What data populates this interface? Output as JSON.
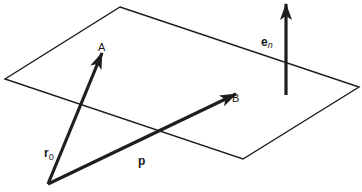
{
  "figure": {
    "colors": {
      "line": "#1e1e1e",
      "background": "#ffffff"
    },
    "plane": {
      "corners": [
        [
          120,
          7
        ],
        [
          359,
          87
        ],
        [
          243,
          159
        ],
        [
          5,
          79
        ]
      ]
    },
    "vectors": {
      "r0": {
        "from": [
          48,
          184
        ],
        "to": [
          102,
          53
        ]
      },
      "p": {
        "from": [
          48,
          184
        ],
        "to": [
          236,
          94
        ]
      },
      "en": {
        "from": [
          286,
          95
        ],
        "to": [
          286,
          4
        ]
      }
    },
    "labels": {
      "point_a": "A",
      "point_b": "B",
      "r0_main": "r",
      "r0_sub": "0",
      "p": "p",
      "en_main": "e",
      "en_sub": "n"
    }
  }
}
